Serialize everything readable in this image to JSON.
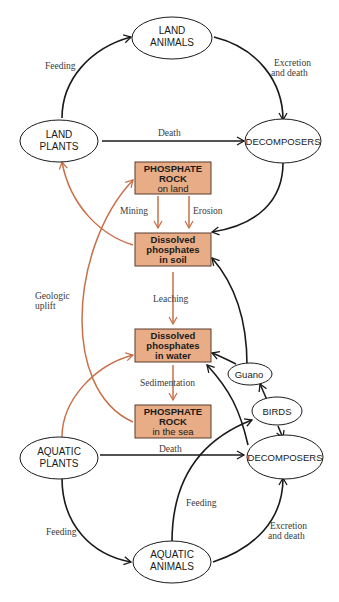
{
  "colors": {
    "black": "#1a1a1a",
    "orange_line": "#c8704a",
    "box_fill": "#e8ad86",
    "box_border": "#5a3a2a"
  },
  "nodes": {
    "land_animals": {
      "line1": "LAND",
      "line2": "ANIMALS"
    },
    "land_plants": {
      "line1": "LAND",
      "line2": "PLANTS"
    },
    "decomposers_land": {
      "line1": "DECOMPOSERS"
    },
    "rock_land": {
      "line1": "PHOSPHATE",
      "line2": "ROCK",
      "line3": "on land"
    },
    "soil": {
      "line1": "Dissolved",
      "line2": "phosphates",
      "line3": "in soil"
    },
    "water": {
      "line1": "Dissolved",
      "line2": "phosphates",
      "line3": "in water"
    },
    "rock_sea": {
      "line1": "PHOSPHATE",
      "line2": "ROCK",
      "line3": "in the sea"
    },
    "guano": {
      "line1": "Guano"
    },
    "birds": {
      "line1": "BIRDS"
    },
    "aquatic_plants": {
      "line1": "AQUATIC",
      "line2": "PLANTS"
    },
    "decomposers_sea": {
      "line1": "DECOMPOSERS"
    },
    "aquatic_animals": {
      "line1": "AQUATIC",
      "line2": "ANIMALS"
    }
  },
  "labels": {
    "feeding_land": "Feeding",
    "excretion_land_1": "Excretion",
    "excretion_land_2": "and death",
    "death_land": "Death",
    "mining": "Mining",
    "erosion": "Erosion",
    "geologic_1": "Geologic",
    "geologic_2": "uplift",
    "leaching": "Leaching",
    "sedimentation": "Sedimentation",
    "death_sea": "Death",
    "feeding_birds": "Feeding",
    "feeding_sea": "Feeding",
    "excretion_sea_1": "Excretion",
    "excretion_sea_2": "and death"
  }
}
